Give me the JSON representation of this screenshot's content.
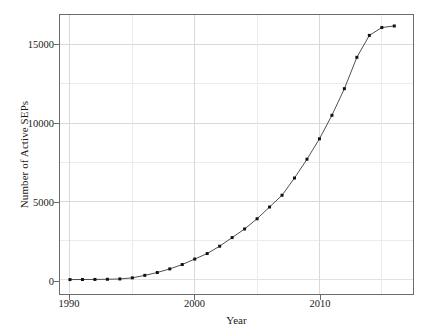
{
  "chart_data": {
    "type": "line",
    "title": "",
    "xlabel": "Year",
    "ylabel": "Number of Active SEPs",
    "xlim": [
      1989.2,
      1989.2
    ],
    "ylim": [
      0,
      0
    ],
    "grid": true,
    "legend": false,
    "marker": "square",
    "line_color": "#3a3a3a",
    "marker_color": "#111111",
    "grid_color": "#d9d9d9",
    "axis_color": "#6b6b6b",
    "x": [
      1990,
      1991,
      1992,
      1993,
      1994,
      1995,
      1996,
      1997,
      1998,
      1999,
      2000,
      2001,
      2002,
      2003,
      2004,
      2005,
      2006,
      2007,
      2008,
      2009,
      2010,
      2011,
      2012,
      2013,
      2014,
      2015,
      2016
    ],
    "values": [
      20,
      25,
      30,
      40,
      60,
      130,
      290,
      470,
      700,
      980,
      1330,
      1680,
      2150,
      2700,
      3250,
      3900,
      4650,
      5400,
      6500,
      7700,
      9000,
      10500,
      12200,
      14200,
      15600,
      16100,
      16200
    ],
    "x_ticks": [
      1990,
      2000,
      2010
    ],
    "x_tick_labels": [
      "1990",
      "2000",
      "2010"
    ],
    "y_ticks": [
      0,
      5000,
      10000,
      15000
    ],
    "y_tick_labels": [
      "0",
      "5000",
      "10000",
      "15000"
    ],
    "y_minor_gridlines": [
      2500,
      7500,
      12500
    ],
    "x_minor_gridlines": [
      1995,
      2005,
      2015
    ],
    "axis_ranges": {
      "x_min": 1989.2,
      "x_max": 1989.2,
      "y_min": 0,
      "y_max": 0
    }
  },
  "axes": {
    "x_title": "Year",
    "y_title": "Number of Active SEPs"
  }
}
